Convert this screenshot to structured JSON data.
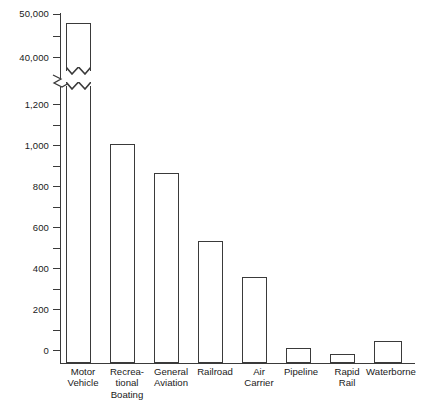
{
  "chart_data": {
    "type": "bar",
    "title": "",
    "subtitle": "",
    "xlabel": "",
    "ylabel": "",
    "categories": [
      "Motor\nVehicle",
      "Recrea-\ntional\nBoating",
      "General\nAviation",
      "Railroad",
      "Air\nCarrier",
      "Pipeline",
      "Rapid\nRail",
      "Waterborne"
    ],
    "values": [
      44500,
      1000,
      870,
      565,
      395,
      70,
      45,
      105
    ],
    "broken_axis": true,
    "axis_segments": [
      {
        "name": "lower",
        "min": 0,
        "max": 1200
      },
      {
        "name": "upper",
        "min": 40000,
        "max": 50000
      }
    ],
    "y_ticks_major": [
      "0",
      "200",
      "400",
      "600",
      "800",
      "1,000",
      "1,200",
      "40,000",
      "50,000"
    ],
    "y_tick_minor_count_lower": 6,
    "y_tick_minor_count_upper": 1,
    "grid": false,
    "legend": "none",
    "bar_fill": "#ffffff",
    "bar_stroke": "#3a3a3a",
    "note_broken_bar": "Motor Vehicle bar exceeds the axis break and is drawn with a break symbol"
  },
  "axis": {
    "y_labels": [
      {
        "text": "50,000",
        "top": 9.0
      },
      {
        "text": "40,000",
        "top": 52.5
      },
      {
        "text": "1,200",
        "top": 99.5
      },
      {
        "text": "1,000",
        "top": 140.5
      },
      {
        "text": "800",
        "top": 181.5
      },
      {
        "text": "600",
        "top": 222.5
      },
      {
        "text": "400",
        "top": 263.5
      },
      {
        "text": "200",
        "top": 304.5
      },
      {
        "text": "0",
        "top": 345.5
      }
    ],
    "y_ticks": [
      {
        "top": 13.6,
        "minor": false
      },
      {
        "top": 35.5,
        "minor": true
      },
      {
        "top": 57.0,
        "minor": false
      },
      {
        "top": 104.0,
        "minor": false
      },
      {
        "top": 124.5,
        "minor": true
      },
      {
        "top": 145.0,
        "minor": false
      },
      {
        "top": 165.5,
        "minor": true
      },
      {
        "top": 186.0,
        "minor": false
      },
      {
        "top": 206.5,
        "minor": true
      },
      {
        "top": 227.0,
        "minor": false
      },
      {
        "top": 247.5,
        "minor": true
      },
      {
        "top": 268.0,
        "minor": false
      },
      {
        "top": 288.5,
        "minor": true
      },
      {
        "top": 309.0,
        "minor": false
      },
      {
        "top": 329.5,
        "minor": true
      },
      {
        "top": 350.0,
        "minor": false
      }
    ]
  },
  "bars": [
    {
      "name": "motor-vehicle",
      "label": "Motor\nVehicle",
      "value": 44500,
      "left": 66,
      "width": 25,
      "top": 22.5,
      "broken": true,
      "break_top": 70.5,
      "break_bottom": 85.5,
      "label_left": 50,
      "label_top": 366
    },
    {
      "name": "recreational-boating",
      "label": "Recrea-\ntional\nBoating",
      "value": 1000,
      "left": 110,
      "width": 25,
      "top": 144.0,
      "broken": false,
      "label_left": 94,
      "label_top": 366
    },
    {
      "name": "general-aviation",
      "label": "General\nAviation",
      "value": 870,
      "left": 154,
      "width": 25,
      "top": 172.5,
      "broken": false,
      "label_left": 138,
      "label_top": 366
    },
    {
      "name": "railroad",
      "label": "Railroad",
      "value": 565,
      "left": 198,
      "width": 25,
      "top": 241.0,
      "broken": false,
      "label_left": 182,
      "label_top": 366
    },
    {
      "name": "air-carrier",
      "label": "Air\nCarrier",
      "value": 395,
      "left": 242,
      "width": 25,
      "top": 277.0,
      "broken": false,
      "label_left": 226,
      "label_top": 366
    },
    {
      "name": "pipeline",
      "label": "Pipeline",
      "value": 70,
      "left": 286,
      "width": 25,
      "top": 348.0,
      "broken": false,
      "label_left": 268,
      "label_top": 366
    },
    {
      "name": "rapid-rail",
      "label": "Rapid\nRail",
      "value": 45,
      "left": 330,
      "width": 25,
      "top": 353.5,
      "broken": false,
      "label_left": 314,
      "label_top": 366
    },
    {
      "name": "waterborne",
      "label": "Waterborne",
      "value": 105,
      "left": 374,
      "width": 28,
      "top": 341.0,
      "broken": false,
      "label_left": 358,
      "label_top": 366
    }
  ]
}
